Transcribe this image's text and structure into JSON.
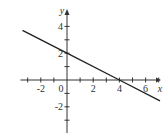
{
  "chart_data": {
    "type": "line",
    "title": "",
    "xlabel": "x",
    "ylabel": "y",
    "xlim": [
      -3.4,
      7.3
    ],
    "ylim": [
      -3.4,
      4.9
    ],
    "x_ticks": [
      -3,
      -2,
      -1,
      0,
      1,
      2,
      3,
      4,
      5,
      6,
      7
    ],
    "x_tick_labels": [
      "-2",
      "0",
      "2",
      "4",
      "6"
    ],
    "x_tick_label_values": [
      -2,
      0,
      2,
      4,
      6
    ],
    "y_ticks": [
      -3,
      -2,
      -1,
      1,
      2,
      3,
      4
    ],
    "y_tick_labels": [
      "4",
      "2",
      "-2"
    ],
    "y_tick_label_values": [
      4,
      2,
      -2
    ],
    "grid": false,
    "legend": null,
    "series": [
      {
        "name": "y = -x/2 + 2",
        "x": [
          -3.4,
          0,
          4,
          7.1
        ],
        "y": [
          3.7,
          2,
          0,
          -1.55
        ]
      }
    ],
    "annotations": [
      {
        "text": "y-intercept (0, 2)"
      },
      {
        "text": "x-intercept (4, 0)"
      }
    ]
  },
  "colors": {
    "axis": "#333333",
    "line": "#222222",
    "background": "#ffffff"
  }
}
